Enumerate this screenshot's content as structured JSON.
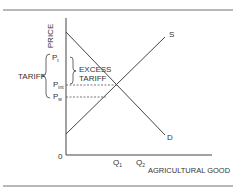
{
  "diagram": {
    "type": "supply-demand",
    "axes": {
      "y_label": "PRICE",
      "x_label": "AGRICULTURAL GOOD",
      "origin_label": "0"
    },
    "curves": {
      "supply_label": "S",
      "demand_label": "D"
    },
    "price_levels": {
      "p_t": {
        "main": "P",
        "sub": "t"
      },
      "p_int": {
        "main": "P",
        "sub": "int"
      },
      "p_w": {
        "main": "P",
        "sub": "w"
      }
    },
    "quantities": {
      "q1": {
        "main": "Q",
        "sub": "1"
      },
      "q2": {
        "main": "Q",
        "sub": "2"
      }
    },
    "annotations": {
      "tariff": "TARIFF",
      "excess_tariff_line1": "EXCESS",
      "excess_tariff_line2": "TARIFF"
    },
    "colors": {
      "line": "#333333",
      "rule": "#999999",
      "dashed": "#555555"
    }
  }
}
